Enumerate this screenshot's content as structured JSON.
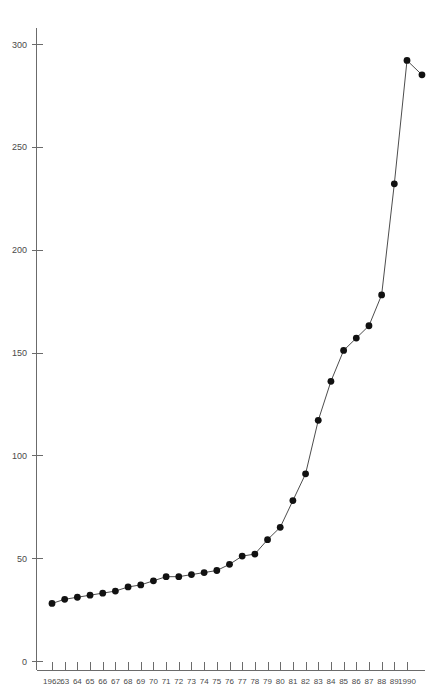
{
  "chart_data": {
    "type": "line",
    "title": "",
    "subtitle": "",
    "xlabel": "",
    "ylabel": "",
    "grid": false,
    "legend": null,
    "legend_position": "none",
    "marker": "filled-circle",
    "line_color": "#4d4d4d",
    "marker_color": "#111111",
    "axis_color": "#6b6b6b",
    "xlim": [
      1962,
      1990
    ],
    "ylim": [
      0,
      310
    ],
    "ytick_values": [
      0,
      50,
      100,
      150,
      200,
      250,
      300
    ],
    "ytick_labels": [
      "0",
      "50",
      "100",
      "150",
      "200",
      "250",
      "300"
    ],
    "x": [
      1962,
      1963,
      1964,
      1965,
      1966,
      1967,
      1968,
      1969,
      1970,
      1971,
      1972,
      1973,
      1974,
      1975,
      1976,
      1977,
      1978,
      1979,
      1980,
      1981,
      1982,
      1983,
      1984,
      1985,
      1986,
      1987,
      1988,
      1989,
      1990
    ],
    "xtick_labels": [
      "1962",
      "63",
      "64",
      "65",
      "66",
      "67",
      "68",
      "69",
      "70",
      "71",
      "72",
      "73",
      "74",
      "75",
      "76",
      "77",
      "78",
      "79",
      "80",
      "81",
      "82",
      "83",
      "84",
      "85",
      "86",
      "87",
      "88",
      "89",
      "1990"
    ],
    "values": [
      28,
      30,
      31,
      32,
      33,
      34,
      36,
      37,
      39,
      41,
      41,
      42,
      43,
      44,
      47,
      51,
      52,
      59,
      65,
      78,
      91,
      117,
      136,
      151,
      157,
      163,
      178,
      232,
      292
    ],
    "points": [
      {
        "x": "1962",
        "y": 28
      },
      {
        "x": "63",
        "y": 30
      },
      {
        "x": "64",
        "y": 31
      },
      {
        "x": "65",
        "y": 32
      },
      {
        "x": "66",
        "y": 33
      },
      {
        "x": "67",
        "y": 34
      },
      {
        "x": "68",
        "y": 36
      },
      {
        "x": "69",
        "y": 37
      },
      {
        "x": "70",
        "y": 39
      },
      {
        "x": "71",
        "y": 41
      },
      {
        "x": "72",
        "y": 41
      },
      {
        "x": "73",
        "y": 42
      },
      {
        "x": "74",
        "y": 43
      },
      {
        "x": "75",
        "y": 44
      },
      {
        "x": "76",
        "y": 47
      },
      {
        "x": "77",
        "y": 51
      },
      {
        "x": "78",
        "y": 52
      },
      {
        "x": "79",
        "y": 59
      },
      {
        "x": "80",
        "y": 65
      },
      {
        "x": "81",
        "y": 78
      },
      {
        "x": "82",
        "y": 91
      },
      {
        "x": "83",
        "y": 117
      },
      {
        "x": "84",
        "y": 136
      },
      {
        "x": "85",
        "y": 151
      },
      {
        "x": "86",
        "y": 157
      },
      {
        "x": "87",
        "y": 163
      },
      {
        "x": "88",
        "y": 178
      },
      {
        "x": "89",
        "y": 232
      },
      {
        "x": "1990",
        "y": 292
      }
    ],
    "extra_points": [
      {
        "x": 1990.55,
        "y": 285,
        "connected_from": 1989,
        "note": "terminal point"
      }
    ]
  }
}
